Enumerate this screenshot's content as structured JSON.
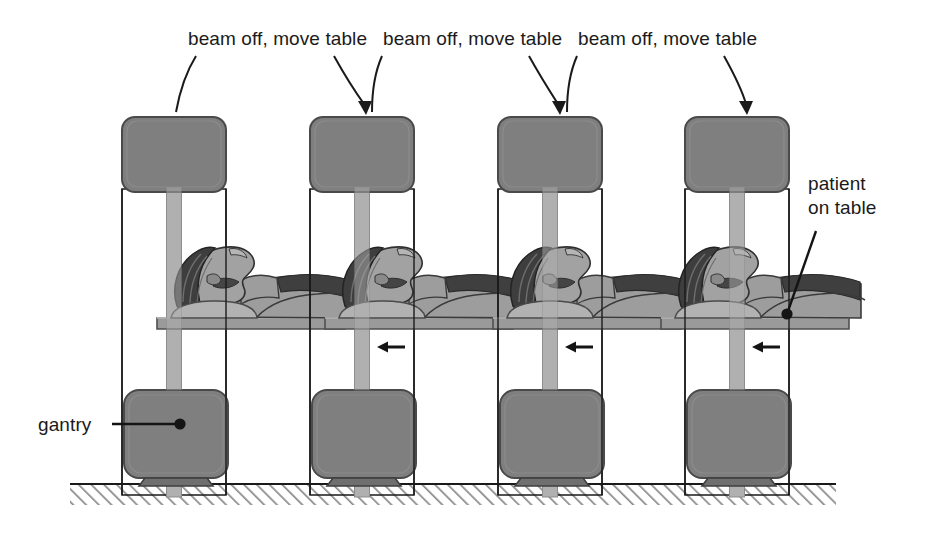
{
  "figure": {
    "kind": "medical-imaging-schematic",
    "background_color": "#ffffff",
    "ink_color": "#1a1a1a",
    "gantry_fill": "#808080",
    "gantry_edge": "#4d4d4d",
    "column_fill": "#b3b3b3",
    "table_fill": "#9a9a9a",
    "patient_skin": "#9d9d9d",
    "patient_hair": "#4a4a4a",
    "ground_hatch_color": "#8c8c8c"
  },
  "top_labels": [
    {
      "id": "label-1",
      "text": "beam off, move table",
      "x": 188,
      "y": 45
    },
    {
      "id": "label-2",
      "text": "beam off, move table",
      "x": 383,
      "y": 45
    },
    {
      "id": "label-3",
      "text": "beam off, move table",
      "x": 578,
      "y": 45
    }
  ],
  "callouts": [
    {
      "id": "callout-gantry",
      "lines": [
        "gantry"
      ],
      "x": 38,
      "y": 431
    },
    {
      "id": "callout-patient",
      "lines": [
        "patient",
        "on table"
      ],
      "x": 808,
      "y": 188
    }
  ],
  "stations": [
    {
      "id": "station-1",
      "index": 1,
      "table_offset": 0,
      "has_move_arrow": false,
      "move_arrow_direction": ""
    },
    {
      "id": "station-2",
      "index": 2,
      "table_offset": -20,
      "has_move_arrow": true,
      "move_arrow_direction": "left"
    },
    {
      "id": "station-3",
      "index": 3,
      "table_offset": -40,
      "has_move_arrow": true,
      "move_arrow_direction": "left"
    },
    {
      "id": "station-4",
      "index": 4,
      "table_offset": -60,
      "has_move_arrow": true,
      "move_arrow_direction": "left"
    }
  ],
  "ground": {
    "label": "floor",
    "x_start": 70,
    "x_end": 836,
    "y": 484
  },
  "annotation_notes": {
    "beam_state_between_stations": "beam off, move table",
    "table_travel_direction": "left (toward gantry / into scanner)",
    "number_of_stations": 4
  }
}
